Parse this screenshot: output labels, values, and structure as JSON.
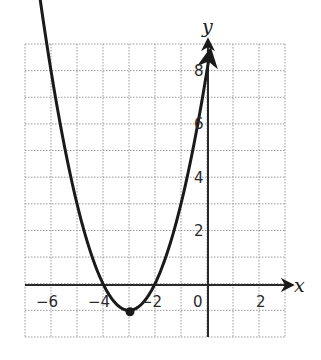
{
  "chart_data": {
    "type": "line",
    "title": "",
    "function": "y = x^2 + 6x + 8",
    "xlabel": "x",
    "ylabel": "y",
    "xlim": [
      -7,
      3
    ],
    "ylim": [
      -2,
      9
    ],
    "grid": true,
    "grid_style": "dotted",
    "x_ticks": [
      {
        "value": -6,
        "label": "−6"
      },
      {
        "value": -4,
        "label": "−4"
      },
      {
        "value": -2,
        "label": "−2"
      },
      {
        "value": 0,
        "label": "0"
      },
      {
        "value": 2,
        "label": "2"
      }
    ],
    "y_ticks": [
      {
        "value": 2,
        "label": "2"
      },
      {
        "value": 4,
        "label": "4"
      },
      {
        "value": 6,
        "label": "6"
      },
      {
        "value": 8,
        "label": "8"
      }
    ],
    "series": [
      {
        "name": "parabola",
        "x": [
          -6.95,
          -6,
          -5,
          -4,
          -3,
          -2,
          -1,
          0,
          0.12
        ],
        "values": [
          8.6,
          8,
          3,
          0,
          -1,
          0,
          3,
          8,
          8.75
        ]
      }
    ],
    "annotations": [
      {
        "type": "point",
        "x": -3,
        "y": -1,
        "label": "vertex"
      }
    ],
    "colors": {
      "curve": "#1a1a1a",
      "axes": "#2a2a2a",
      "grid": "#9a9a9a"
    }
  },
  "labels": {
    "x_axis": "x",
    "y_axis": "y",
    "x_ticks": [
      "−6",
      "−4",
      "−2",
      "0",
      "2"
    ],
    "y_ticks": [
      "2",
      "4",
      "6",
      "8"
    ]
  }
}
